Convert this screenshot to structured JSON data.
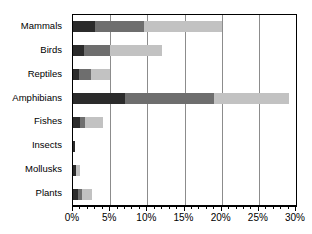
{
  "chart_data": {
    "type": "bar",
    "orientation": "horizontal",
    "stacked": true,
    "title": "",
    "subtitle": "",
    "xlabel": "",
    "ylabel": "",
    "xlim": [
      0,
      30
    ],
    "xtick_labels": [
      "0%",
      "5%",
      "10%",
      "15%",
      "20%",
      "25%",
      "30%"
    ],
    "xtick_values": [
      0,
      5,
      10,
      15,
      20,
      25,
      30
    ],
    "minor_tick_interval": 1,
    "grid": true,
    "grid_axis": "x",
    "legend": "none",
    "categories": [
      "Mammals",
      "Birds",
      "Reptiles",
      "Amphibians",
      "Fishes",
      "Insects",
      "Mollusks",
      "Plants"
    ],
    "series": [
      {
        "name": "segment-1",
        "color": "#2b2b2b",
        "values": [
          3.0,
          1.5,
          0.8,
          7.0,
          1.0,
          0.3,
          0.4,
          0.7
        ]
      },
      {
        "name": "segment-2",
        "color": "#6e6e6e",
        "values": [
          6.5,
          3.5,
          1.6,
          12.0,
          0.6,
          0.0,
          0.0,
          0.5
        ]
      },
      {
        "name": "segment-3",
        "color": "#c2c2c2",
        "values": [
          10.5,
          7.0,
          2.6,
          10.0,
          2.4,
          0.0,
          0.6,
          1.3
        ]
      }
    ],
    "totals": [
      20.0,
      12.0,
      5.0,
      29.0,
      4.0,
      0.3,
      1.0,
      2.5
    ]
  },
  "colors": {
    "segment_dark": "#2b2b2b",
    "segment_medium": "#6e6e6e",
    "segment_light": "#c2c2c2",
    "gridline": "#8c8c8c",
    "axis": "#000000",
    "background": "#ffffff",
    "text": "#000000"
  }
}
